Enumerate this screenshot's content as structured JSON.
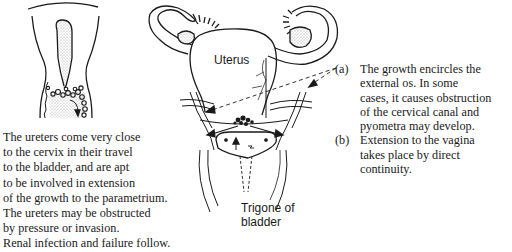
{
  "figure": {
    "left_panel": {
      "caption_lines": [
        "The ureters come very close",
        "to the cervix in their travel",
        "to the bladder, and are apt",
        "to be involved in extension",
        "of the growth to the parametrium.",
        "The ureters may be obstructed",
        "by pressure or invasion.",
        "Renal infection and failure follow."
      ]
    },
    "center_panel": {
      "labels": {
        "uterus": "Uterus",
        "trigone_line1": "Trigone of",
        "trigone_line2": "bladder"
      }
    },
    "notes": [
      {
        "marker": "(a)",
        "lines": [
          "The growth encircles the",
          "external os. In some",
          "cases, it causes obstruction",
          "of the cervical canal and",
          "pyometra may develop."
        ]
      },
      {
        "marker": "(b)",
        "lines": [
          "Extension to the vagina",
          "takes place by direct",
          "continuity."
        ]
      }
    ],
    "colors": {
      "ink": "#1a1a1a",
      "stipple": "#bdbdbd",
      "background": "#ffffff"
    }
  }
}
